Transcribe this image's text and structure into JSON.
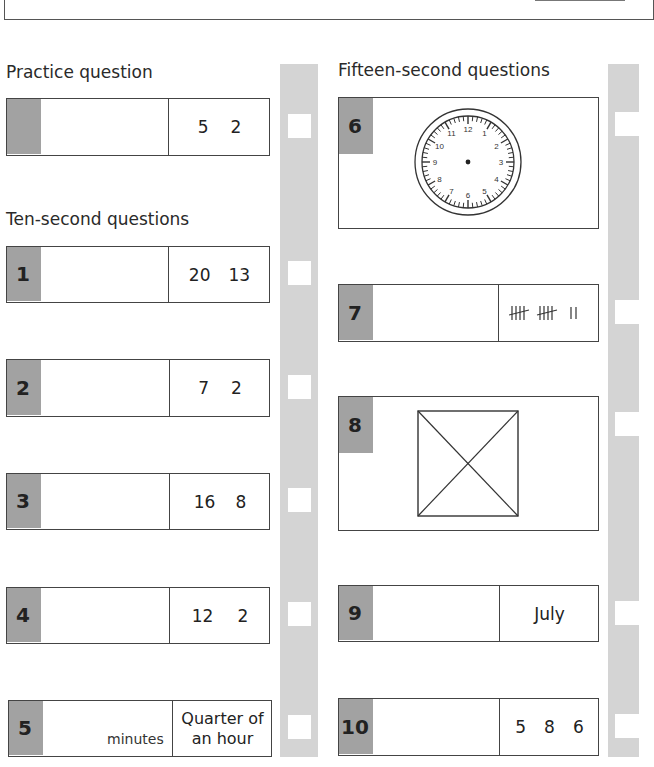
{
  "page": {
    "section_practice": "Practice question",
    "section_ten_second": "Ten-second questions",
    "section_fifteen_second": "Fifteen-second questions"
  },
  "colors": {
    "number_tab": "#a2a2a2",
    "answer_strip": "#d4d4d4",
    "border": "#444444"
  },
  "practice": {
    "number": "",
    "values": [
      "5",
      "2"
    ]
  },
  "ten_second_questions": [
    {
      "number": "1",
      "values": [
        "20",
        "13"
      ]
    },
    {
      "number": "2",
      "values": [
        "7",
        "2"
      ]
    },
    {
      "number": "3",
      "values": [
        "16",
        "8"
      ]
    },
    {
      "number": "4",
      "values": [
        "12",
        "2"
      ]
    },
    {
      "number": "5",
      "unit": "minutes",
      "prompt_line1": "Quarter of",
      "prompt_line2": "an hour"
    }
  ],
  "fifteen_second_questions": [
    {
      "number": "6",
      "figure": "clock-face",
      "clock_numbers": [
        "12",
        "1",
        "2",
        "3",
        "4",
        "5",
        "6",
        "7",
        "8",
        "9",
        "10",
        "11"
      ]
    },
    {
      "number": "7",
      "figure": "tally-marks",
      "tally": "5 5 2"
    },
    {
      "number": "8",
      "figure": "square-with-diagonals"
    },
    {
      "number": "9",
      "prompt": "July"
    },
    {
      "number": "10",
      "values": [
        "5",
        "8",
        "6"
      ]
    }
  ]
}
